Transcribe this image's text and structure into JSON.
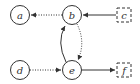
{
  "diagram": {
    "type": "directed-graph",
    "colors": {
      "stroke": "#333333",
      "background": "#ffffff"
    },
    "nodes": [
      {
        "id": "a",
        "label": "a",
        "shape": "circle",
        "style": "solid",
        "cx": 20,
        "cy": 15
      },
      {
        "id": "b",
        "label": "b",
        "shape": "circle",
        "style": "solid",
        "cx": 72,
        "cy": 15
      },
      {
        "id": "c",
        "label": "c",
        "shape": "square",
        "style": "dashed",
        "cx": 124,
        "cy": 15
      },
      {
        "id": "d",
        "label": "d",
        "shape": "circle",
        "style": "solid",
        "cx": 20,
        "cy": 70
      },
      {
        "id": "e",
        "label": "e",
        "shape": "circle",
        "style": "solid",
        "cx": 72,
        "cy": 70
      },
      {
        "id": "f",
        "label": "f",
        "shape": "square",
        "style": "dashed",
        "cx": 124,
        "cy": 70
      }
    ],
    "edges": [
      {
        "from": "b",
        "to": "a",
        "style": "dotted"
      },
      {
        "from": "c",
        "to": "b",
        "style": "solid"
      },
      {
        "from": "b",
        "to": "e",
        "style": "dotted",
        "curved": true
      },
      {
        "from": "e",
        "to": "b",
        "style": "solid",
        "curved": true
      },
      {
        "from": "d",
        "to": "e",
        "style": "dotted"
      },
      {
        "from": "e",
        "to": "f",
        "style": "solid"
      }
    ]
  }
}
